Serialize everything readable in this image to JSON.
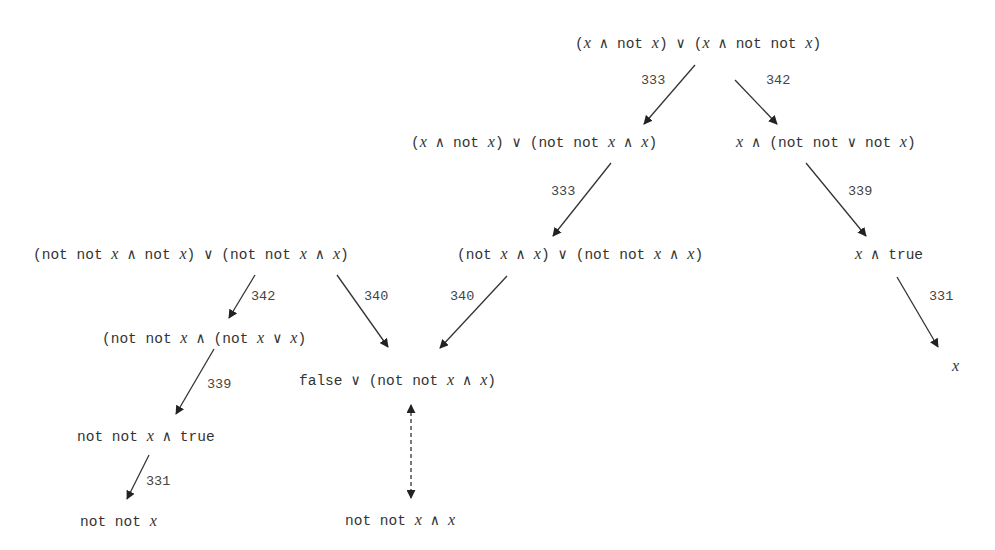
{
  "diagram": {
    "type": "rewrite-tree",
    "background": "#ffffff",
    "text_color": "#333333",
    "edge_color": "#333333",
    "nodes": [
      {
        "id": "n0",
        "text": "(x ∧ not x) ∨ (x ∧ not not x)",
        "x": 575,
        "y": 43
      },
      {
        "id": "n1",
        "text": "(x ∧ not x) ∨ (not not x ∧ x)",
        "x": 411,
        "y": 142
      },
      {
        "id": "n2",
        "text": "x ∧ (not not ∨ not x)",
        "x": 736,
        "y": 142
      },
      {
        "id": "n3",
        "text": "(not not x ∧ not x) ∨ (not not x ∧ x)",
        "x": 33,
        "y": 254
      },
      {
        "id": "n4",
        "text": "(not x ∧ x) ∨ (not not x ∧ x)",
        "x": 457,
        "y": 254
      },
      {
        "id": "n5",
        "text": "x ∧ true",
        "x": 855,
        "y": 254
      },
      {
        "id": "n6",
        "text": "(not not x ∧ (not x ∨ x)",
        "x": 102,
        "y": 338
      },
      {
        "id": "n7",
        "text": "false ∨ (not not x ∧ x)",
        "x": 299,
        "y": 380
      },
      {
        "id": "n8",
        "text": "x",
        "x": 952,
        "y": 366
      },
      {
        "id": "n9",
        "text": "not not x ∧ true",
        "x": 77,
        "y": 436
      },
      {
        "id": "n10",
        "text": "not not x",
        "x": 80,
        "y": 521
      },
      {
        "id": "n11",
        "text": "not not x ∧ x",
        "x": 345,
        "y": 520
      }
    ],
    "edges": [
      {
        "from": "n0",
        "to": "n1",
        "label": "333",
        "x1": 695,
        "y1": 65,
        "x2": 644,
        "y2": 124,
        "lx": 641,
        "ly": 81,
        "style": "solid"
      },
      {
        "from": "n0",
        "to": "n2",
        "label": "342",
        "x1": 735,
        "y1": 80,
        "x2": 777,
        "y2": 124,
        "lx": 766,
        "ly": 81,
        "style": "solid"
      },
      {
        "from": "n1",
        "to": "n4",
        "label": "333",
        "x1": 611,
        "y1": 163,
        "x2": 553,
        "y2": 236,
        "lx": 551,
        "ly": 192,
        "style": "solid"
      },
      {
        "from": "n2",
        "to": "n5",
        "label": "339",
        "x1": 806,
        "y1": 163,
        "x2": 866,
        "y2": 236,
        "lx": 848,
        "ly": 192,
        "style": "solid"
      },
      {
        "from": "n3",
        "to": "n6",
        "label": "342",
        "x1": 255,
        "y1": 275,
        "x2": 229,
        "y2": 318,
        "lx": 251,
        "ly": 297,
        "style": "solid"
      },
      {
        "from": "n3",
        "to": "n7",
        "label": "340",
        "x1": 337,
        "y1": 275,
        "x2": 388,
        "y2": 347,
        "lx": 364,
        "ly": 297,
        "style": "solid"
      },
      {
        "from": "n4",
        "to": "n7",
        "label": "340",
        "x1": 507,
        "y1": 276,
        "x2": 440,
        "y2": 348,
        "lx": 450,
        "ly": 297,
        "style": "solid"
      },
      {
        "from": "n5",
        "to": "n8",
        "label": "331",
        "x1": 897,
        "y1": 277,
        "x2": 938,
        "y2": 347,
        "lx": 929,
        "ly": 297,
        "style": "solid"
      },
      {
        "from": "n6",
        "to": "n9",
        "label": "339",
        "x1": 214,
        "y1": 349,
        "x2": 176,
        "y2": 414,
        "lx": 207,
        "ly": 385,
        "style": "solid"
      },
      {
        "from": "n9",
        "to": "n10",
        "label": "331",
        "x1": 149,
        "y1": 455,
        "x2": 127,
        "y2": 499,
        "lx": 146,
        "ly": 482,
        "style": "solid"
      },
      {
        "from": "n7",
        "to": "n11",
        "label": "",
        "x1": 411,
        "y1": 405,
        "x2": 411,
        "y2": 498,
        "lx": 0,
        "ly": 0,
        "style": "dashed-bidirectional"
      }
    ]
  }
}
